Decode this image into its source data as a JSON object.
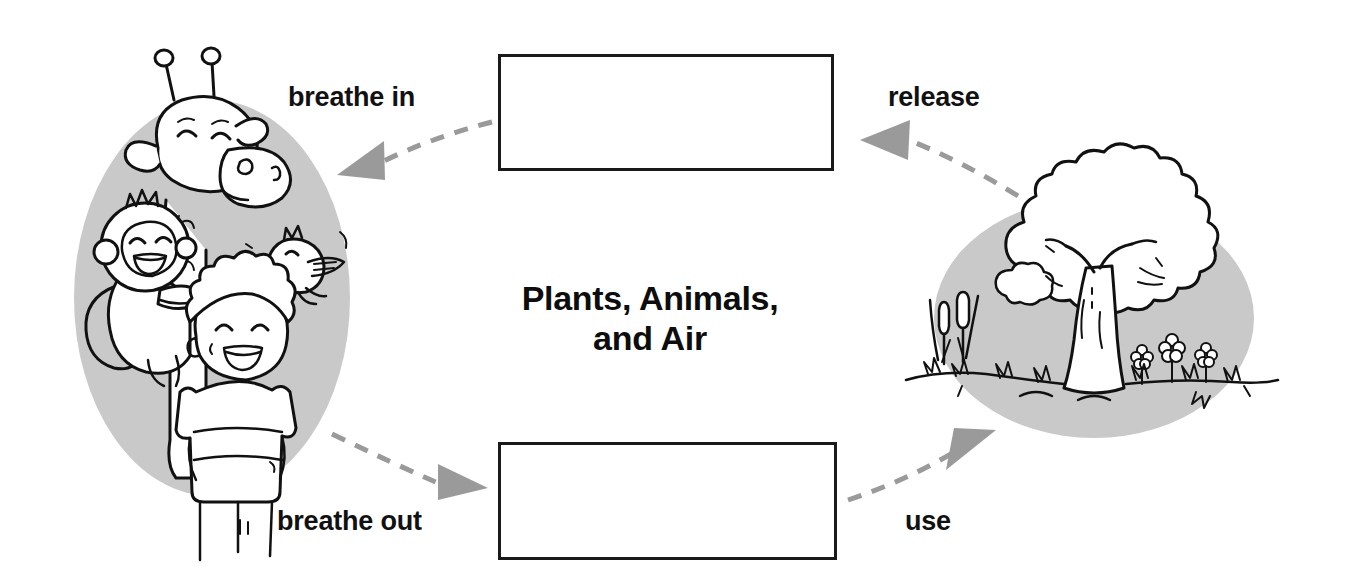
{
  "page": {
    "width": 1347,
    "height": 584,
    "background_color": "#ffffff"
  },
  "title": {
    "line1": "Plants, Animals,",
    "line2": "and Air"
  },
  "labels": {
    "breathe_in": "breathe in",
    "release": "release",
    "breathe_out": "breathe out",
    "use": "use"
  },
  "boxes": [
    {
      "id": "top",
      "text": "",
      "note": "empty fill-in box, top center"
    },
    {
      "id": "bottom",
      "text": "",
      "note": "empty fill-in box, bottom center"
    }
  ],
  "illustrations": {
    "left": {
      "name": "animals-and-boy",
      "backdrop_color": "#c9c9c9",
      "subjects": [
        "giraffe",
        "monkey",
        "bird",
        "boy"
      ]
    },
    "right": {
      "name": "tree-and-plants",
      "backdrop_color": "#c9c9c9",
      "subjects": [
        "tree",
        "cattails",
        "flowers",
        "grass"
      ]
    }
  },
  "colors": {
    "ink": "#111111",
    "backdrop_gray": "#c9c9c9",
    "arrow_gray": "#9a9a9a",
    "box_border": "#1a1a1a"
  },
  "arrows": [
    {
      "id": "release-to-box",
      "from": "tree",
      "to": "top-box",
      "label": "release",
      "direction": "right-to-left"
    },
    {
      "id": "box-to-animals",
      "from": "top-box",
      "to": "animals",
      "label": "breathe in",
      "direction": "right-to-left"
    },
    {
      "id": "animals-to-box",
      "from": "animals",
      "to": "bottom-box",
      "label": "breathe out",
      "direction": "left-to-right"
    },
    {
      "id": "box-to-tree",
      "from": "bottom-box",
      "to": "tree",
      "label": "use",
      "direction": "left-to-right"
    }
  ]
}
